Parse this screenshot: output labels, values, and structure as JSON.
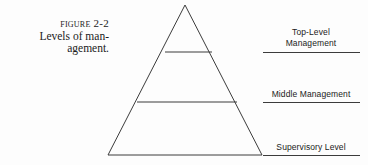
{
  "figure": {
    "caption": {
      "line1": "Figure 2-2",
      "line2": "Levels of man-",
      "line3": "agement."
    },
    "diagram": {
      "type": "pyramid",
      "shape": "triangle",
      "apex": {
        "x": 185,
        "y": 5
      },
      "base_left": {
        "x": 108,
        "y": 155
      },
      "base_right": {
        "x": 262,
        "y": 155
      },
      "stroke_color": "#3c3c3c",
      "fill_color": "none",
      "divider_lines": [
        {
          "y": 52,
          "x_left": 165,
          "x_right": 212
        },
        {
          "y": 102,
          "x_left": 137,
          "x_right": 237
        }
      ],
      "bands": [
        {
          "name": "top-level",
          "label": "Top-Level Management"
        },
        {
          "name": "middle",
          "label": "Middle Management"
        },
        {
          "name": "supervisory",
          "label": "Supervisory Level"
        }
      ]
    },
    "labels": {
      "top": {
        "line1": "Top-Level",
        "line2": "Management"
      },
      "middle": {
        "line1": "Middle Management"
      },
      "bottom": {
        "line1": "Supervisory Level"
      }
    }
  }
}
